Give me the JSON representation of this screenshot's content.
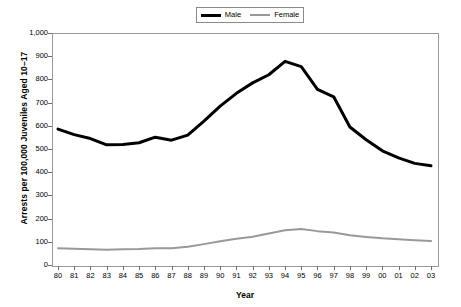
{
  "chart_data": {
    "type": "line",
    "title": "",
    "xlabel": "Year",
    "ylabel": "Arrests per 100,000 Juveniles Aged 10–17",
    "categories": [
      "80",
      "81",
      "82",
      "83",
      "84",
      "85",
      "86",
      "87",
      "88",
      "89",
      "90",
      "91",
      "92",
      "93",
      "94",
      "95",
      "96",
      "97",
      "98",
      "99",
      "00",
      "01",
      "02",
      "03"
    ],
    "x_tick_labels": [
      "80",
      "81",
      "82",
      "83",
      "84",
      "85",
      "86",
      "87",
      "88",
      "89",
      "90",
      "91",
      "92",
      "93",
      "94",
      "95",
      "96",
      "97",
      "98",
      "99",
      "00",
      "01",
      "02",
      "03"
    ],
    "y_tick_labels": [
      "0",
      "100",
      "200",
      "300",
      "400",
      "500",
      "600",
      "700",
      "800",
      "900",
      "1,000"
    ],
    "y_ticks": [
      0,
      100,
      200,
      300,
      400,
      500,
      600,
      700,
      800,
      900,
      1000
    ],
    "ylim": [
      0,
      1000
    ],
    "grid": false,
    "legend_position": "top-center",
    "series": [
      {
        "name": "Male",
        "color": "#000000",
        "width": 3,
        "values": [
          586,
          562,
          545,
          518,
          519,
          527,
          551,
          538,
          560,
          620,
          685,
          740,
          785,
          820,
          878,
          855,
          757,
          725,
          595,
          540,
          492,
          462,
          438,
          428
        ]
      },
      {
        "name": "Female",
        "color": "#999999",
        "width": 2,
        "values": [
          72,
          70,
          68,
          66,
          68,
          69,
          72,
          72,
          79,
          90,
          102,
          113,
          122,
          136,
          150,
          155,
          146,
          140,
          128,
          121,
          115,
          111,
          107,
          103
        ]
      }
    ]
  },
  "legend": {
    "entries": [
      {
        "label": "Male"
      },
      {
        "label": "Female"
      }
    ]
  },
  "axes": {
    "x_title": "Year",
    "y_title": "Arrests per 100,000 Juveniles Aged 10–17"
  }
}
